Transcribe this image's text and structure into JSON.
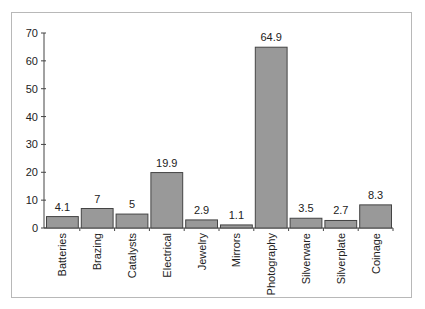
{
  "chart_data": {
    "type": "bar",
    "title": "",
    "xlabel": "",
    "ylabel": "",
    "categories": [
      "Batteries",
      "Brazing",
      "Catalysts",
      "Electrical",
      "Jewelry",
      "Mirrors",
      "Photography",
      "Silverware",
      "Silverplate",
      "Coinage"
    ],
    "values": [
      4.1,
      7,
      5,
      19.9,
      2.9,
      1.1,
      64.9,
      3.5,
      2.7,
      8.3
    ],
    "value_labels": [
      "4.1",
      "7",
      "5",
      "19.9",
      "2.9",
      "1.1",
      "64.9",
      "3.5",
      "2.7",
      "8.3"
    ],
    "ylim": [
      0,
      70
    ],
    "yticks": [
      0,
      10,
      20,
      30,
      40,
      50,
      60,
      70
    ],
    "grid": false,
    "legend": null,
    "bar_color": "#999999",
    "bar_edge_color": "#444444"
  }
}
